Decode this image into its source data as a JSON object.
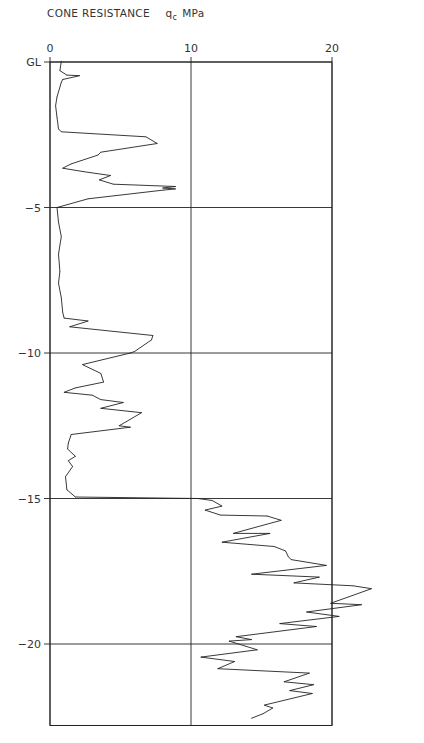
{
  "chart_data": {
    "type": "line",
    "title": "CONE RESISTANCE",
    "title_symbol": "q",
    "title_symbol_subscript": "c",
    "title_unit": "MPa",
    "xlabel": "Cone resistance qc (MPa)",
    "ylabel": "Depth (m)",
    "x_ticks": [
      0,
      10,
      20
    ],
    "x_tick_labels": [
      "0",
      "10",
      "20"
    ],
    "y_ticks": [
      0,
      -5,
      -10,
      -15,
      -20
    ],
    "y_tick_labels": [
      "GL",
      "-5",
      "-10",
      "-15",
      "-20"
    ],
    "xlim": [
      0,
      20
    ],
    "ylim": [
      -22.8,
      0
    ],
    "grid": true,
    "legend": "none",
    "series": [
      {
        "name": "qc",
        "points": [
          [
            0.8,
            0.03
          ],
          [
            0.7,
            -0.3
          ],
          [
            1.2,
            -0.45
          ],
          [
            2.1,
            -0.47
          ],
          [
            0.9,
            -0.6
          ],
          [
            0.8,
            -0.7
          ],
          [
            0.5,
            -1.2
          ],
          [
            0.4,
            -1.5
          ],
          [
            0.5,
            -1.9
          ],
          [
            0.6,
            -2.3
          ],
          [
            0.8,
            -2.4
          ],
          [
            6.8,
            -2.57
          ],
          [
            7.6,
            -2.8
          ],
          [
            3.6,
            -3.1
          ],
          [
            3.4,
            -3.2
          ],
          [
            1.5,
            -3.5
          ],
          [
            0.9,
            -3.65
          ],
          [
            2.4,
            -3.77
          ],
          [
            4.3,
            -3.9
          ],
          [
            3.5,
            -4.05
          ],
          [
            4.5,
            -4.2
          ],
          [
            8.9,
            -4.28
          ],
          [
            8.0,
            -4.33
          ],
          [
            8.9,
            -4.36
          ],
          [
            8.1,
            -4.4
          ],
          [
            2.7,
            -4.7
          ],
          [
            0.5,
            -5.0
          ],
          [
            0.6,
            -5.5
          ],
          [
            0.8,
            -6.0
          ],
          [
            0.6,
            -6.6
          ],
          [
            0.7,
            -7.2
          ],
          [
            0.6,
            -7.6
          ],
          [
            0.8,
            -8.1
          ],
          [
            0.9,
            -8.6
          ],
          [
            1.0,
            -8.8
          ],
          [
            2.7,
            -8.9
          ],
          [
            1.4,
            -9.1
          ],
          [
            7.3,
            -9.4
          ],
          [
            7.2,
            -9.55
          ],
          [
            6.0,
            -9.95
          ],
          [
            5.7,
            -10.0
          ],
          [
            2.3,
            -10.4
          ],
          [
            3.6,
            -10.7
          ],
          [
            3.8,
            -11.0
          ],
          [
            1.8,
            -11.2
          ],
          [
            1.0,
            -11.35
          ],
          [
            3.0,
            -11.45
          ],
          [
            3.6,
            -11.6
          ],
          [
            5.2,
            -11.7
          ],
          [
            3.6,
            -11.9
          ],
          [
            6.5,
            -12.05
          ],
          [
            4.9,
            -12.5
          ],
          [
            5.7,
            -12.55
          ],
          [
            1.5,
            -12.8
          ],
          [
            1.3,
            -13.1
          ],
          [
            1.25,
            -13.3
          ],
          [
            1.8,
            -13.55
          ],
          [
            1.3,
            -13.7
          ],
          [
            1.6,
            -13.9
          ],
          [
            1.1,
            -14.25
          ],
          [
            1.2,
            -14.7
          ],
          [
            1.8,
            -14.95
          ],
          [
            10.5,
            -15.0
          ],
          [
            11.5,
            -15.07
          ],
          [
            12.2,
            -15.26
          ],
          [
            11.0,
            -15.4
          ],
          [
            12.1,
            -15.57
          ],
          [
            15.4,
            -15.6
          ],
          [
            16.4,
            -15.75
          ],
          [
            13.0,
            -16.2
          ],
          [
            15.6,
            -16.2
          ],
          [
            12.2,
            -16.5
          ],
          [
            15.9,
            -16.65
          ],
          [
            16.7,
            -16.8
          ],
          [
            16.9,
            -17.0
          ],
          [
            17.1,
            -17.1
          ],
          [
            19.6,
            -17.3
          ],
          [
            14.3,
            -17.6
          ],
          [
            19.1,
            -17.7
          ],
          [
            17.3,
            -17.9
          ],
          [
            21.5,
            -18.0
          ],
          [
            22.8,
            -18.1
          ],
          [
            19.9,
            -18.6
          ],
          [
            22.1,
            -18.65
          ],
          [
            18.2,
            -18.9
          ],
          [
            20.5,
            -19.05
          ],
          [
            16.3,
            -19.3
          ],
          [
            18.9,
            -19.4
          ],
          [
            13.2,
            -19.75
          ],
          [
            14.3,
            -19.85
          ],
          [
            12.7,
            -19.9
          ],
          [
            14.7,
            -20.2
          ],
          [
            10.7,
            -20.45
          ],
          [
            13.1,
            -20.6
          ],
          [
            11.9,
            -20.85
          ],
          [
            18.4,
            -21.0
          ],
          [
            16.6,
            -21.3
          ],
          [
            18.7,
            -21.4
          ],
          [
            17.0,
            -21.6
          ],
          [
            18.6,
            -21.7
          ],
          [
            15.2,
            -22.1
          ],
          [
            15.8,
            -22.2
          ],
          [
            15.1,
            -22.4
          ],
          [
            14.3,
            -22.55
          ]
        ]
      }
    ]
  }
}
